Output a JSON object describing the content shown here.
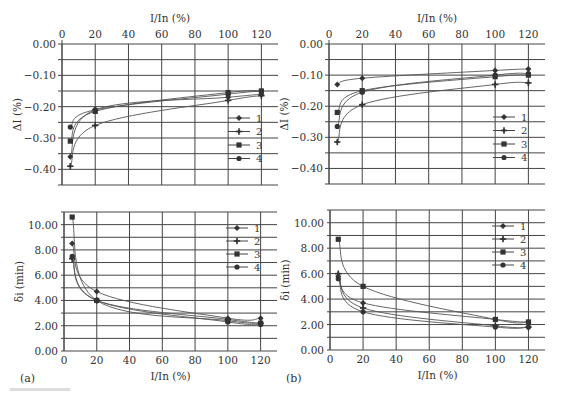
{
  "panels": {
    "a": {
      "label": "(a)"
    },
    "b": {
      "label": "(b)"
    }
  },
  "axes": {
    "x_label": "I/In (%)",
    "x_ticks": [
      "0",
      "20",
      "40",
      "60",
      "80",
      "100",
      "120"
    ],
    "dI_label": "ΔI (%)",
    "dI_ticks": [
      "0.00",
      "-0.10",
      "-0.20",
      "-0.30",
      "-0.40"
    ],
    "di_label": "δi (min)",
    "di_ticks": [
      "10.00",
      "8.00",
      "6.00",
      "4.00",
      "2.00",
      "0.00"
    ]
  },
  "legend": [
    "1",
    "2",
    "3",
    "4"
  ],
  "chart_data": [
    {
      "id": "a-top",
      "type": "line",
      "title": "",
      "xlabel": "I/In (%)",
      "ylabel": "ΔI (%)",
      "x": [
        5,
        20,
        100,
        120
      ],
      "xlim": [
        0,
        130
      ],
      "ylim": [
        -0.45,
        0.0
      ],
      "x_axis_position": "top",
      "grid": true,
      "legend_position": "right-middle",
      "series": [
        {
          "name": "1",
          "marker": "diamond",
          "values": [
            -0.36,
            -0.21,
            -0.17,
            -0.16
          ]
        },
        {
          "name": "2",
          "marker": "plus",
          "values": [
            -0.39,
            -0.26,
            -0.18,
            -0.165
          ]
        },
        {
          "name": "3",
          "marker": "square",
          "values": [
            -0.31,
            -0.215,
            -0.155,
            -0.15
          ]
        },
        {
          "name": "4",
          "marker": "circle",
          "values": [
            -0.265,
            -0.21,
            -0.16,
            -0.15
          ]
        }
      ]
    },
    {
      "id": "b-top",
      "type": "line",
      "title": "",
      "xlabel": "I/In (%)",
      "ylabel": "ΔI (%)",
      "x": [
        5,
        20,
        100,
        120
      ],
      "xlim": [
        0,
        130
      ],
      "ylim": [
        -0.45,
        0.0
      ],
      "x_axis_position": "top",
      "grid": true,
      "legend_position": "right-middle",
      "series": [
        {
          "name": "1",
          "marker": "diamond",
          "values": [
            -0.13,
            -0.11,
            -0.085,
            -0.08
          ]
        },
        {
          "name": "2",
          "marker": "plus",
          "values": [
            -0.315,
            -0.195,
            -0.13,
            -0.125
          ]
        },
        {
          "name": "3",
          "marker": "square",
          "values": [
            -0.22,
            -0.15,
            -0.105,
            -0.1
          ]
        },
        {
          "name": "4",
          "marker": "circle",
          "values": [
            -0.265,
            -0.155,
            -0.1,
            -0.095
          ]
        }
      ]
    },
    {
      "id": "a-bottom",
      "type": "line",
      "title": "",
      "xlabel": "I/In (%)",
      "ylabel": "δi (min)",
      "x": [
        5,
        20,
        100,
        120
      ],
      "xlim": [
        0,
        130
      ],
      "ylim": [
        0,
        11
      ],
      "grid": true,
      "legend_position": "upper-right",
      "series": [
        {
          "name": "1",
          "marker": "diamond",
          "values": [
            8.5,
            4.7,
            2.6,
            2.6
          ]
        },
        {
          "name": "2",
          "marker": "plus",
          "values": [
            7.3,
            4.0,
            2.5,
            2.2
          ]
        },
        {
          "name": "3",
          "marker": "square",
          "values": [
            10.6,
            4.0,
            2.4,
            2.2
          ]
        },
        {
          "name": "4",
          "marker": "circle",
          "values": [
            7.5,
            4.0,
            2.3,
            2.1
          ]
        }
      ]
    },
    {
      "id": "b-bottom",
      "type": "line",
      "title": "",
      "xlabel": "I/In (%)",
      "ylabel": "δi (min)",
      "x": [
        5,
        20,
        100,
        120
      ],
      "xlim": [
        0,
        130
      ],
      "ylim": [
        0,
        11
      ],
      "grid": true,
      "legend_position": "upper-right",
      "series": [
        {
          "name": "1",
          "marker": "diamond",
          "values": [
            5.8,
            3.7,
            2.4,
            2.2
          ]
        },
        {
          "name": "2",
          "marker": "plus",
          "values": [
            6.0,
            3.3,
            1.9,
            1.8
          ]
        },
        {
          "name": "3",
          "marker": "square",
          "values": [
            8.7,
            5.0,
            2.4,
            2.2
          ]
        },
        {
          "name": "4",
          "marker": "circle",
          "values": [
            5.6,
            3.0,
            1.8,
            1.8
          ]
        }
      ]
    }
  ]
}
